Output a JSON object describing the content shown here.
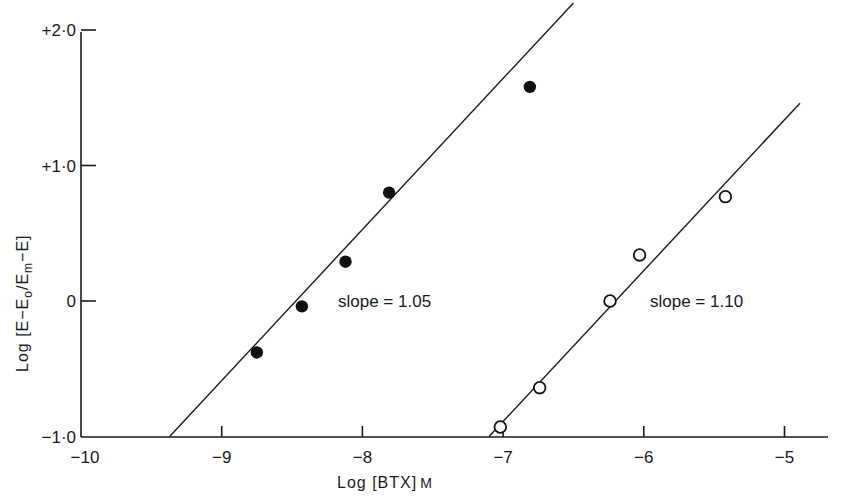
{
  "chart_data": {
    "type": "scatter",
    "title": "",
    "xlabel": "Log [BTX] M",
    "ylabel": "Log [E-E0/Em-E]",
    "xlim": [
      -10,
      -4.7
    ],
    "ylim": [
      -1.0,
      2.0
    ],
    "grid": false,
    "legend": null,
    "x_ticks": [
      -10,
      -9,
      -8,
      -7,
      -6,
      -5
    ],
    "x_tick_labels": [
      "-10",
      "-9",
      "-8",
      "-7",
      "-6",
      "-5"
    ],
    "y_ticks": [
      -1.0,
      0,
      1.0,
      2.0
    ],
    "y_tick_labels": [
      "-1·0",
      "0",
      "+1·0",
      "+2·0"
    ],
    "series": [
      {
        "name": "filled circles",
        "marker": "filled-circle",
        "x": [
          -8.75,
          -8.43,
          -8.12,
          -7.81,
          -6.81
        ],
        "y": [
          -0.38,
          -0.04,
          0.29,
          0.8,
          1.58
        ],
        "fit_line": {
          "x": [
            -9.37,
            -6.5
          ],
          "y": [
            -1.0,
            2.2
          ]
        },
        "slope_label": "slope = 1.05"
      },
      {
        "name": "open circles",
        "marker": "open-circle",
        "x": [
          -7.02,
          -6.74,
          -6.24,
          -6.03,
          -5.42
        ],
        "y": [
          -0.93,
          -0.64,
          0.0,
          0.34,
          0.77
        ],
        "fit_line": {
          "x": [
            -7.1,
            -4.89
          ],
          "y": [
            -1.0,
            1.46
          ]
        },
        "slope_label": "slope = 1.10"
      }
    ],
    "annotations": [
      {
        "text": "slope = 1.05",
        "x": -8.1,
        "y": -0.05
      },
      {
        "text": "slope = 1.10",
        "x": -5.9,
        "y": -0.05
      }
    ]
  },
  "labels": {
    "xlabel_main": "Log [BTX]",
    "xlabel_unit": "M",
    "ylabel_text": "Log [E−E",
    "ylabel_sub0": "o",
    "ylabel_mid": "/E",
    "ylabel_subm": "m",
    "ylabel_end": "−E]"
  }
}
